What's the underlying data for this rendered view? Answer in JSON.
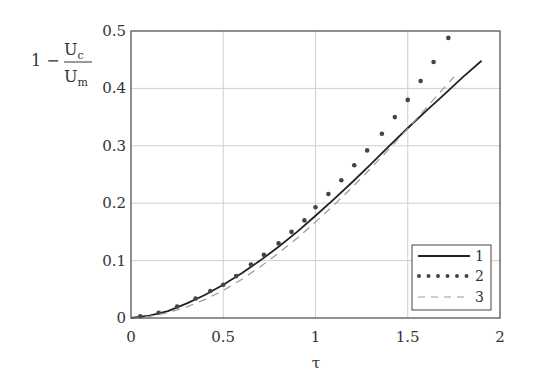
{
  "chart_data": {
    "type": "line",
    "title": "",
    "xlabel": "τ",
    "ylabel": "1 − Uc/Um",
    "ylabel_parts": {
      "prefix": "1 −",
      "numerator": "U",
      "numerator_sub": "c",
      "denominator": "U",
      "denominator_sub": "m"
    },
    "xlim": [
      0,
      2
    ],
    "ylim": [
      0,
      0.5
    ],
    "xticks": [
      0,
      0.5,
      1,
      1.5,
      2
    ],
    "xtick_labels": [
      "0",
      "0.5",
      "1",
      "1.5",
      "2"
    ],
    "yticks": [
      0,
      0.1,
      0.2,
      0.3,
      0.4,
      0.5
    ],
    "ytick_labels": [
      "0",
      "0.1",
      "0.2",
      "0.3",
      "0.4",
      "0.5"
    ],
    "grid": true,
    "legend_position": "lower right",
    "series": [
      {
        "name": "1",
        "style": "solid",
        "color": "#222222",
        "x": [
          0,
          0.1,
          0.2,
          0.3,
          0.4,
          0.5,
          0.6,
          0.7,
          0.8,
          0.9,
          1.0,
          1.1,
          1.2,
          1.3,
          1.4,
          1.5,
          1.6,
          1.7,
          1.8,
          1.9
        ],
        "y": [
          0,
          0.004,
          0.012,
          0.025,
          0.04,
          0.058,
          0.078,
          0.1,
          0.124,
          0.15,
          0.178,
          0.207,
          0.237,
          0.268,
          0.3,
          0.331,
          0.361,
          0.39,
          0.42,
          0.448
        ]
      },
      {
        "name": "2",
        "style": "dotted",
        "color": "#444444",
        "x": [
          0.05,
          0.15,
          0.25,
          0.35,
          0.43,
          0.5,
          0.57,
          0.65,
          0.72,
          0.8,
          0.87,
          0.94,
          1.0,
          1.07,
          1.14,
          1.21,
          1.28,
          1.36,
          1.43,
          1.5,
          1.57,
          1.64,
          1.72
        ],
        "y": [
          0.003,
          0.009,
          0.02,
          0.034,
          0.047,
          0.058,
          0.073,
          0.093,
          0.11,
          0.13,
          0.15,
          0.17,
          0.193,
          0.216,
          0.24,
          0.266,
          0.292,
          0.321,
          0.35,
          0.38,
          0.413,
          0.446,
          0.488
        ]
      },
      {
        "name": "3",
        "style": "dashed",
        "color": "#999999",
        "x": [
          0,
          0.1,
          0.2,
          0.3,
          0.4,
          0.5,
          0.6,
          0.7,
          0.8,
          0.9,
          1.0,
          1.1,
          1.2,
          1.3,
          1.4,
          1.5,
          1.6,
          1.7,
          1.75
        ],
        "y": [
          0,
          0.003,
          0.009,
          0.019,
          0.032,
          0.048,
          0.067,
          0.089,
          0.113,
          0.139,
          0.167,
          0.197,
          0.228,
          0.261,
          0.295,
          0.33,
          0.366,
          0.402,
          0.42
        ]
      }
    ]
  }
}
